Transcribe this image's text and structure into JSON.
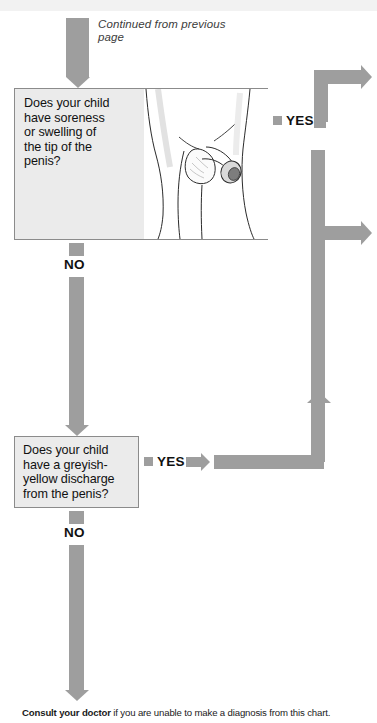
{
  "page": {
    "continued_note": "Continued from\nprevious page",
    "footer_bold": "Consult your doctor",
    "footer_rest": " if you are unable to make a diagnosis from this chart."
  },
  "colors": {
    "arrow_gray": "#9e9e9e",
    "box_fill": "#ebebeb",
    "box_border": "#8b8b8b",
    "text": "#111111"
  },
  "questions": [
    {
      "id": "q1",
      "text": "Does your child\nhave soreness\nor swelling of\nthe tip of the\npenis?",
      "yes_label": "YES",
      "no_label": "NO",
      "illustration_name": "penis-soreness-illustration"
    },
    {
      "id": "q2",
      "text": "Does your child\nhave a greyish-\nyellow discharge\nfrom the penis?",
      "yes_label": "YES",
      "no_label": "NO"
    }
  ],
  "labels": {
    "q1_yes": "YES",
    "q1_no": "NO",
    "q2_yes": "YES",
    "q2_no": "NO"
  }
}
